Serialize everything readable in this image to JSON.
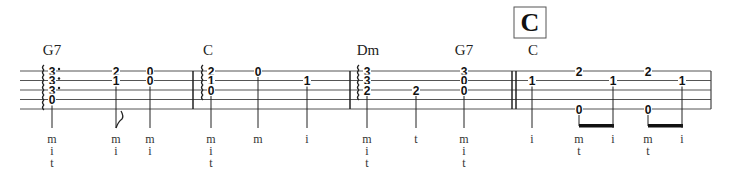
{
  "staff": {
    "x_start": 20,
    "x_end": 711,
    "line_y": [
      71,
      80.5,
      90,
      99.5,
      109
    ],
    "color": "#333333",
    "barlines": [
      193,
      350
    ],
    "double_barline": [
      512,
      516
    ],
    "end_barline": 711
  },
  "rehearsal_mark": {
    "label": "C",
    "x": 514,
    "y": 7,
    "w": 32,
    "h": 31
  },
  "chord_names": [
    {
      "label": "G7",
      "x": 52
    },
    {
      "label": "C",
      "x": 208
    },
    {
      "label": "Dm",
      "x": 368
    },
    {
      "label": "G7",
      "x": 464
    },
    {
      "label": "C",
      "x": 533
    }
  ],
  "notes": [
    {
      "x": 52,
      "frets": [
        {
          "s": 0,
          "f": "3"
        },
        {
          "s": 1,
          "f": "3"
        },
        {
          "s": 2,
          "f": "3"
        },
        {
          "s": 3,
          "f": "0"
        }
      ],
      "roll": true,
      "dots": true,
      "fingers": [
        "m",
        "i",
        "t"
      ]
    },
    {
      "x": 116,
      "frets": [
        {
          "s": 0,
          "f": "2"
        },
        {
          "s": 1,
          "f": "1"
        }
      ],
      "flag": true,
      "fingers": [
        "m",
        "i"
      ]
    },
    {
      "x": 150,
      "frets": [
        {
          "s": 0,
          "f": "0"
        },
        {
          "s": 1,
          "f": "0"
        }
      ],
      "fingers": [
        "m",
        "i"
      ]
    },
    {
      "x": 211,
      "frets": [
        {
          "s": 0,
          "f": "2"
        },
        {
          "s": 1,
          "f": "1"
        },
        {
          "s": 2,
          "f": "0"
        }
      ],
      "roll": true,
      "fingers": [
        "m",
        "i",
        "t"
      ]
    },
    {
      "x": 258,
      "frets": [
        {
          "s": 0,
          "f": "0"
        }
      ],
      "fingers": [
        "m"
      ]
    },
    {
      "x": 307,
      "frets": [
        {
          "s": 1,
          "f": "1"
        }
      ],
      "fingers": [
        "i"
      ]
    },
    {
      "x": 367,
      "frets": [
        {
          "s": 0,
          "f": "3"
        },
        {
          "s": 1,
          "f": "3"
        },
        {
          "s": 2,
          "f": "2"
        }
      ],
      "roll": true,
      "fingers": [
        "m",
        "i",
        "t"
      ]
    },
    {
      "x": 416,
      "frets": [
        {
          "s": 2,
          "f": "2"
        }
      ],
      "fingers": [
        "t"
      ]
    },
    {
      "x": 464,
      "frets": [
        {
          "s": 0,
          "f": "3"
        },
        {
          "s": 1,
          "f": "0"
        },
        {
          "s": 2,
          "f": "0"
        }
      ],
      "fingers": [
        "m",
        "i",
        "t"
      ]
    },
    {
      "x": 532,
      "frets": [
        {
          "s": 1,
          "f": "1"
        }
      ],
      "fingers": [
        "i"
      ]
    },
    {
      "x": 579,
      "frets": [
        {
          "s": 0,
          "f": "2"
        },
        {
          "s": 4,
          "f": "0"
        }
      ],
      "fingers": [
        "m",
        "t"
      ],
      "stem_from": 4,
      "beam_to": 613
    },
    {
      "x": 613,
      "frets": [
        {
          "s": 1,
          "f": "1"
        }
      ],
      "fingers": [
        "i"
      ],
      "stem_from": 1
    },
    {
      "x": 648,
      "frets": [
        {
          "s": 0,
          "f": "2"
        },
        {
          "s": 4,
          "f": "0"
        }
      ],
      "fingers": [
        "m",
        "t"
      ],
      "stem_from": 4,
      "beam_to": 682
    },
    {
      "x": 682,
      "frets": [
        {
          "s": 1,
          "f": "1"
        }
      ],
      "fingers": [
        "i"
      ],
      "stem_from": 1
    }
  ],
  "layout": {
    "chord_name_y": 55,
    "stem_bottom": 128,
    "finger_y": [
      143,
      155,
      167
    ]
  }
}
